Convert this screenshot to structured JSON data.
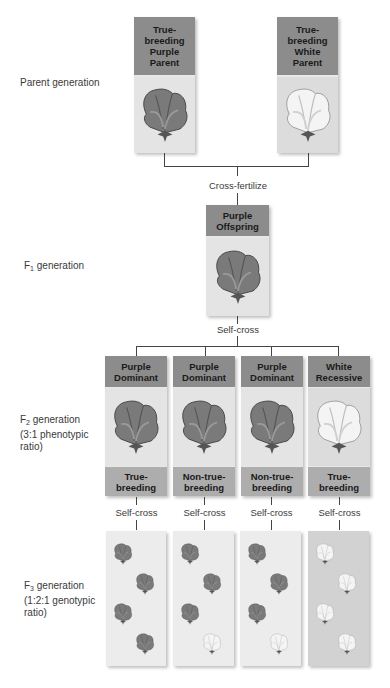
{
  "generations": {
    "parent": "Parent generation",
    "f1": {
      "prefix": "F",
      "sub": "1",
      "suffix": " generation"
    },
    "f2": {
      "prefix": "F",
      "sub": "2",
      "suffix": " generation",
      "line2": "(3:1 phenotypic",
      "line3": "ratio)"
    },
    "f3": {
      "prefix": "F",
      "sub": "3",
      "suffix": " generation",
      "line2": "(1:2:1 genotypic",
      "line3": "ratio)"
    }
  },
  "parents": [
    {
      "label": "True-\nbreeding\nPurple\nParent",
      "flower": "purple"
    },
    {
      "label": "True-\nbreeding\nWhite\nParent",
      "flower": "white"
    }
  ],
  "steps": {
    "cross": "Cross-fertilize",
    "self_cross_f1": "Self-cross",
    "self_cross_f2": [
      "Self-cross",
      "Self-cross",
      "Self-cross",
      "Self-cross"
    ]
  },
  "f1": {
    "label": "Purple\nOffspring",
    "flower": "purple"
  },
  "f2": [
    {
      "label": "Purple\nDominant",
      "breeding": "True-\nbreeding",
      "flower": "purple"
    },
    {
      "label": "Purple\nDominant",
      "breeding": "Non-true-\nbreeding",
      "flower": "purple"
    },
    {
      "label": "Purple\nDominant",
      "breeding": "Non-true-\nbreeding",
      "flower": "purple"
    },
    {
      "label": "White\nRecessive",
      "breeding": "True-\nbreeding",
      "flower": "white"
    }
  ],
  "f3": [
    {
      "flowers": [
        "purple",
        "purple",
        "purple",
        "purple"
      ]
    },
    {
      "flowers": [
        "purple",
        "purple",
        "purple",
        "white"
      ]
    },
    {
      "flowers": [
        "purple",
        "purple",
        "purple",
        "white"
      ]
    },
    {
      "flowers": [
        "white",
        "white",
        "white",
        "white"
      ]
    }
  ],
  "colors": {
    "header": "#8c8c8c",
    "footer": "#adadad",
    "purple_flower": "#7a7a7a",
    "white_flower": "#f2f2f2"
  }
}
